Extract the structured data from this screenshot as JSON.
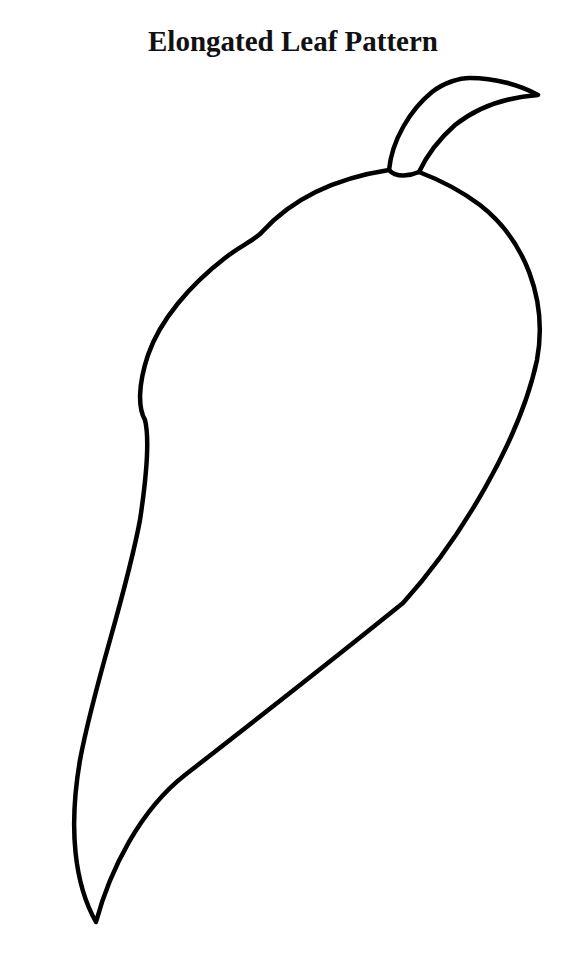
{
  "title": "Elongated Leaf Pattern",
  "figure": {
    "stroke_color": "#000000",
    "background_color": "#ffffff"
  }
}
